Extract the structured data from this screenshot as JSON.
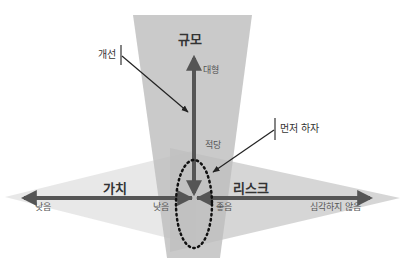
{
  "diagram": {
    "axes": {
      "scale": {
        "title": "규모",
        "high_label": "대형",
        "low_label": "적당"
      },
      "value": {
        "title": "가치",
        "left_label": "낮음",
        "center_label": "낮음"
      },
      "risk": {
        "title": "리스크",
        "center_label": "좋음",
        "right_label": "심각하지 않음"
      }
    },
    "callouts": {
      "improve": "개선",
      "do_first": "먼저 하자"
    },
    "colors": {
      "funnel": "#bdbdbd",
      "left_triangle": "#e6e6e6",
      "right_triangle": "#cfcfcf",
      "arrow": "#555555",
      "text": "#333333"
    }
  }
}
